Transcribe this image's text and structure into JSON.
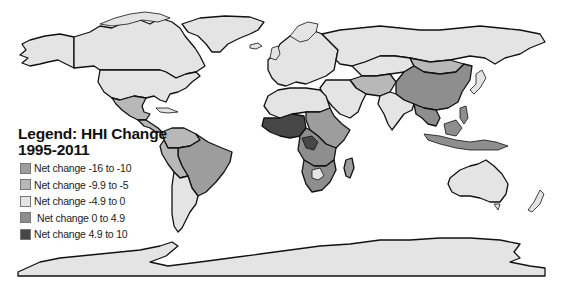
{
  "legend": {
    "title_line1": "Legend: HHI Change",
    "title_line2": "1995-2011",
    "items": [
      {
        "label": "Net change -16 to -10",
        "color": "#9d9d9d"
      },
      {
        "label": "Net change -9.9 to -5",
        "color": "#b8b8b8"
      },
      {
        "label": "Net change -4.9 to 0",
        "color": "#e4e4e4"
      },
      {
        "label": "Net change 0 to 4.9",
        "color": "#8e8e8e"
      },
      {
        "label": "Net change 4.9 to 10",
        "color": "#474747"
      }
    ]
  },
  "regions": [
    {
      "name": "Alaska",
      "class": "Net change -4.9 to 0"
    },
    {
      "name": "Canada",
      "class": "Net change -4.9 to 0"
    },
    {
      "name": "Greenland",
      "class": "Net change -4.9 to 0"
    },
    {
      "name": "United States",
      "class": "Net change -4.9 to 0"
    },
    {
      "name": "Mexico",
      "class": "Net change -9.9 to -5"
    },
    {
      "name": "Central America",
      "class": "Net change -9.9 to -5"
    },
    {
      "name": "Colombia / Venezuela",
      "class": "Net change -9.9 to -5"
    },
    {
      "name": "Brazil",
      "class": "Net change -16 to -10"
    },
    {
      "name": "Peru / Bolivia",
      "class": "Net change -9.9 to -5"
    },
    {
      "name": "Argentina / Chile",
      "class": "Net change -4.9 to 0"
    },
    {
      "name": "Europe",
      "class": "Net change -4.9 to 0"
    },
    {
      "name": "North Africa",
      "class": "Net change -4.9 to 0"
    },
    {
      "name": "West Africa",
      "class": "Net change 4.9 to 10"
    },
    {
      "name": "Central Africa",
      "class": "Net change 0 to 4.9"
    },
    {
      "name": "East Africa",
      "class": "Net change -16 to -10"
    },
    {
      "name": "Southern Africa",
      "class": "Net change 0 to 4.9"
    },
    {
      "name": "Botswana",
      "class": "Net change -4.9 to 0"
    },
    {
      "name": "Madagascar",
      "class": "Net change -16 to -10"
    },
    {
      "name": "Middle East",
      "class": "Net change -4.9 to 0"
    },
    {
      "name": "Russia",
      "class": "Net change -4.9 to 0"
    },
    {
      "name": "Kazakhstan",
      "class": "Net change -4.9 to 0"
    },
    {
      "name": "Central Asia",
      "class": "Net change -9.9 to -5"
    },
    {
      "name": "China",
      "class": "Net change 0 to 4.9"
    },
    {
      "name": "Mongolia",
      "class": "Net change -9.9 to -5"
    },
    {
      "name": "India",
      "class": "Net change -4.9 to 0"
    },
    {
      "name": "Southeast Asia",
      "class": "Net change 0 to 4.9"
    },
    {
      "name": "Indonesia",
      "class": "Net change 0 to 4.9"
    },
    {
      "name": "Japan",
      "class": "Net change -4.9 to 0"
    },
    {
      "name": "Australia",
      "class": "Net change -4.9 to 0"
    },
    {
      "name": "New Zealand",
      "class": "Net change -4.9 to 0"
    },
    {
      "name": "Antarctica",
      "class": "Net change -4.9 to 0"
    }
  ]
}
